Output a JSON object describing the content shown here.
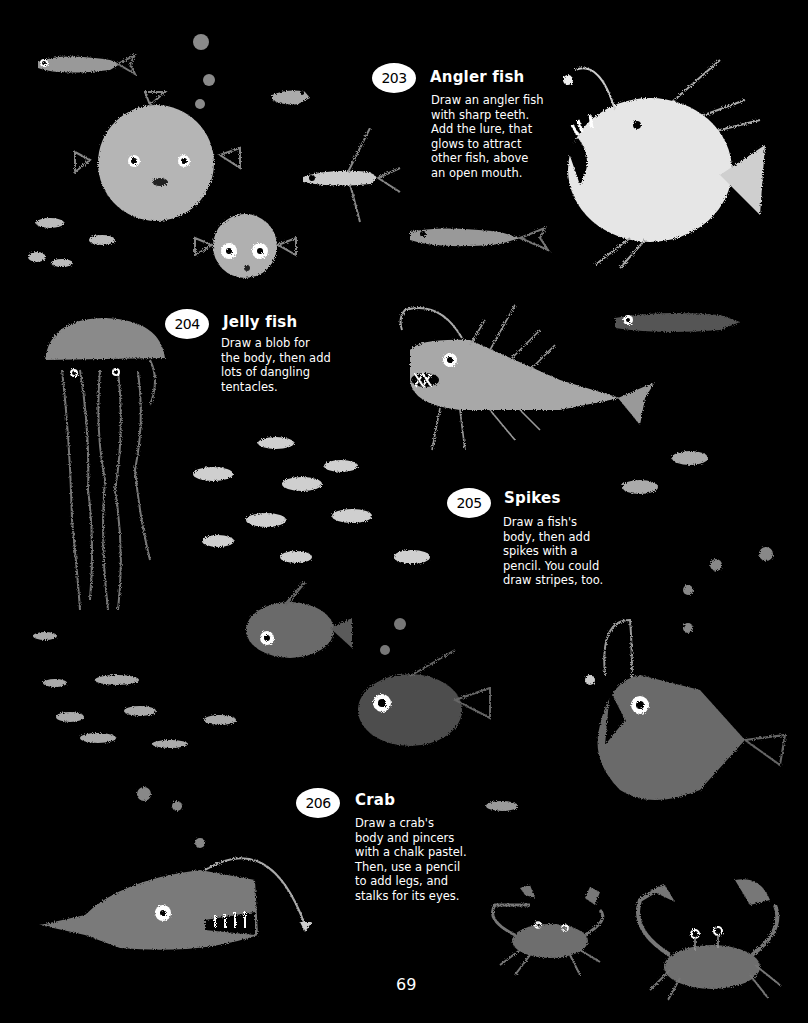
{
  "page": {
    "background": "#000000",
    "page_number": "69"
  },
  "steps": [
    {
      "number": "203",
      "title": "Angler fish",
      "lines": [
        "Draw an angler fish",
        "with sharp teeth.",
        "Add the lure, that",
        "glows to attract",
        "other fish, above",
        "an open mouth."
      ]
    },
    {
      "number": "204",
      "title": "Jelly fish",
      "lines": [
        "Draw a blob for",
        "the body, then add",
        "lots of dangling",
        "tentacles."
      ]
    },
    {
      "number": "205",
      "title": "Spikes",
      "lines": [
        "Draw a fish's",
        "body, then add",
        "spikes with a",
        "pencil. You could",
        "draw stripes, too."
      ]
    },
    {
      "number": "206",
      "title": "Crab",
      "lines": [
        "Draw a crab's",
        "body and pincers",
        "with a chalk pastel.",
        "Then, use a pencil",
        "to add legs, and",
        "stalks for its eyes."
      ]
    }
  ],
  "illustrations": [
    {
      "name": "pufferfish-large",
      "color": "#b8b8b8"
    },
    {
      "name": "pufferfish-small",
      "color": "#b0b0b0"
    },
    {
      "name": "angler-fish-white",
      "color": "#e8e8e8"
    },
    {
      "name": "jellyfish",
      "color": "#8a8a8a"
    },
    {
      "name": "spiky-angler-fish",
      "color": "#a8a8a8"
    },
    {
      "name": "dark-angler-fish",
      "color": "#6a6a6a"
    },
    {
      "name": "long-angler-fish",
      "color": "#7a7a7a"
    },
    {
      "name": "crab-left",
      "color": "#6e6e6e"
    },
    {
      "name": "crab-right",
      "color": "#6e6e6e"
    },
    {
      "name": "fish-school",
      "color": "#cfcfcf"
    }
  ]
}
